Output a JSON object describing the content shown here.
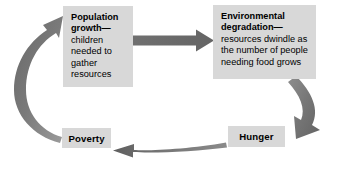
{
  "diagram": {
    "colors": {
      "box_fill": "#d8d8d8",
      "arrow_fill": "#707070",
      "arrow_fill_light": "#9a9a9a",
      "background": "#ffffff",
      "text": "#000000"
    },
    "nodes": [
      {
        "id": "population-growth",
        "title": "Population growth—",
        "body": "children needed to gather resources",
        "body_lines": [
          "children",
          "needed",
          "to gather",
          "resources"
        ],
        "title_lines": [
          "Population",
          "growth—"
        ]
      },
      {
        "id": "environmental-degradation",
        "title": "Environmental degradation—",
        "body": "resources dwindle as the number of people needing food grows",
        "body_lines": [
          "resources dwindle",
          "as the number of",
          "people needing",
          "food grows"
        ],
        "title_lines": [
          "Environmental",
          "degradation—"
        ]
      },
      {
        "id": "hunger",
        "title": "Hunger",
        "body": "",
        "body_lines": [],
        "title_lines": [
          "Hunger"
        ]
      },
      {
        "id": "poverty",
        "title": "Poverty",
        "body": "",
        "body_lines": [],
        "title_lines": [
          "Poverty"
        ]
      }
    ],
    "arrows": [
      {
        "id": "arrow-population-to-environment",
        "from": "population-growth",
        "to": "environmental-degradation",
        "shape": "straight-horizontal",
        "direction": "right"
      },
      {
        "id": "arrow-environment-to-hunger",
        "from": "environmental-degradation",
        "to": "hunger",
        "shape": "curved",
        "direction": "down-left"
      },
      {
        "id": "arrow-hunger-to-poverty",
        "from": "hunger",
        "to": "poverty",
        "shape": "shallow-curve-horizontal",
        "direction": "left"
      },
      {
        "id": "arrow-poverty-to-population",
        "from": "poverty",
        "to": "population-growth",
        "shape": "curved",
        "direction": "up-right"
      }
    ]
  }
}
